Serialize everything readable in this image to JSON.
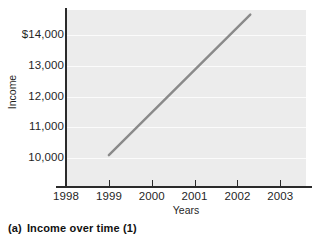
{
  "caption": {
    "tag": "(a)",
    "text": "Income over time (1)"
  },
  "chart_data": {
    "type": "line",
    "title": "",
    "subtitle": "",
    "xlabel": "Years",
    "ylabel": "Income",
    "xlim": [
      1998,
      2003.6
    ],
    "ylim": [
      9100,
      14800
    ],
    "xticks": [
      1998,
      1999,
      2000,
      2001,
      2002,
      2003
    ],
    "xtick_labels": [
      "1998",
      "1999",
      "2000",
      "2001",
      "2002",
      "2003"
    ],
    "yticks": [
      10000,
      11000,
      12000,
      13000,
      14000
    ],
    "ytick_labels": [
      "10,000",
      "11,000",
      "12,000",
      "13,000",
      "$14,000"
    ],
    "grid": "horizontal",
    "grid_color": "#fbfbfb",
    "plot_background": "#ececec",
    "legend": "none",
    "series": [
      {
        "name": "Income",
        "color": "#8a8a8a",
        "line_width": 2.4,
        "x": [
          1999.0,
          2002.3
        ],
        "values": [
          10100,
          14650
        ]
      }
    ],
    "annotations": []
  },
  "colors": {
    "line": "#8a8a8a",
    "axis": "#2b2b2b",
    "plot_bg": "#ececec",
    "grid": "#fbfbfb",
    "text": "#1f1f1f",
    "page_bg": "#ffffff"
  }
}
